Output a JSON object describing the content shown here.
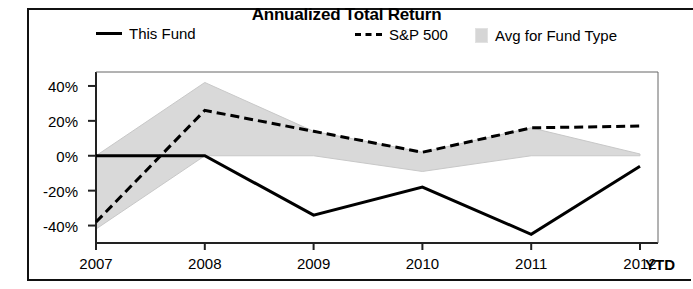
{
  "chart_data": {
    "type": "line",
    "title": "Annualized Total Return",
    "xlabel": "",
    "ylabel": "",
    "categories": [
      "2007",
      "2008",
      "2009",
      "2010",
      "2011",
      "2012"
    ],
    "x_axis_note": "YTD",
    "ylim": [
      -50,
      48
    ],
    "yticks": [
      40,
      20,
      0,
      -20,
      -40
    ],
    "ytick_labels": [
      "40%",
      "20%",
      "0%",
      "-20%",
      "-40%"
    ],
    "grid": false,
    "legend_position": "top",
    "series": [
      {
        "name": "This Fund",
        "style": "solid-line",
        "color": "#000000",
        "values": [
          0,
          0,
          -34,
          -18,
          -45,
          -6
        ]
      },
      {
        "name": "S&P 500",
        "style": "dashed-line",
        "color": "#000000",
        "values": [
          -38,
          26,
          14,
          2,
          16,
          17
        ]
      },
      {
        "name": "Avg for Fund Type",
        "style": "shaded-band",
        "color": "#d9d9d9",
        "upper": [
          0,
          42,
          14,
          2,
          16,
          1
        ],
        "lower": [
          -42,
          0,
          0,
          -9,
          0,
          0
        ]
      }
    ]
  },
  "legend": {
    "items": [
      {
        "label": "This Fund",
        "swatch": "solid-line-swatch"
      },
      {
        "label": "S&P 500",
        "swatch": "dashed-line-swatch"
      },
      {
        "label": "Avg for Fund Type",
        "swatch": "gray-box-swatch"
      }
    ]
  },
  "axis": {
    "y_labels": [
      "40%",
      "20%",
      "0%",
      "-20%",
      "-40%"
    ],
    "x_labels": [
      "2007",
      "2008",
      "2009",
      "2010",
      "2011",
      "2012"
    ],
    "x_suffix_label": "YTD"
  },
  "colors": {
    "band_fill": "#d9d9d9",
    "line": "#000000",
    "frame": "#111111",
    "background": "#ffffff"
  }
}
